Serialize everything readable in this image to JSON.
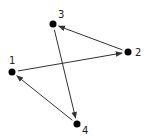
{
  "diagram": {
    "type": "directed-graph",
    "nodes": [
      {
        "id": "1",
        "label": "1",
        "x": 12,
        "y": 72,
        "lx": 9,
        "ly": 64
      },
      {
        "id": "2",
        "label": "2",
        "x": 128,
        "y": 52,
        "lx": 135,
        "ly": 56
      },
      {
        "id": "3",
        "label": "3",
        "x": 53,
        "y": 24,
        "lx": 58,
        "ly": 18
      },
      {
        "id": "4",
        "label": "4",
        "x": 77,
        "y": 124,
        "lx": 82,
        "ly": 134
      }
    ],
    "edges": [
      {
        "from": "1",
        "to": "2"
      },
      {
        "from": "2",
        "to": "3"
      },
      {
        "from": "3",
        "to": "4"
      },
      {
        "from": "4",
        "to": "1"
      }
    ],
    "colors": {
      "node": "#000000",
      "edge": "#333333",
      "label": "#222222"
    }
  }
}
